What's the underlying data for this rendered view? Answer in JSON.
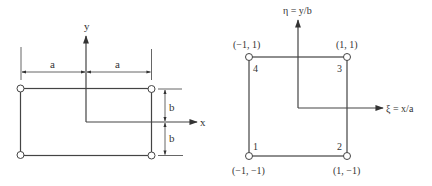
{
  "left_diagram": {
    "axis_x_label": "x",
    "axis_y_label": "y",
    "dim_a_left": "a",
    "dim_a_right": "a",
    "dim_b_top": "b",
    "dim_b_bottom": "b"
  },
  "right_diagram": {
    "axis_eta_label": "η = y/b",
    "axis_xi_label": "ξ = x/a",
    "nodes": [
      {
        "number": "1",
        "coord": "(−1, −1)"
      },
      {
        "number": "2",
        "coord": "(1, −1)"
      },
      {
        "number": "3",
        "coord": "(1, 1)"
      },
      {
        "number": "4",
        "coord": "(−1, 1)"
      }
    ]
  },
  "colors": {
    "stroke": "#444444",
    "background": "#ffffff"
  }
}
